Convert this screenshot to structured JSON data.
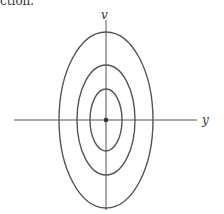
{
  "caption_fragment": "ction.",
  "diagram": {
    "type": "contour-ellipses",
    "axes": {
      "vertical_label": "v",
      "horizontal_label": "y"
    },
    "center": {
      "x": 106,
      "y": 120
    },
    "ellipses": [
      {
        "name": "inner",
        "rx": 16,
        "ry": 31
      },
      {
        "name": "middle",
        "rx": 29,
        "ry": 55
      },
      {
        "name": "outer",
        "rx": 47,
        "ry": 88
      }
    ],
    "stroke_color": "#555555",
    "center_dot_color": "#333333"
  }
}
